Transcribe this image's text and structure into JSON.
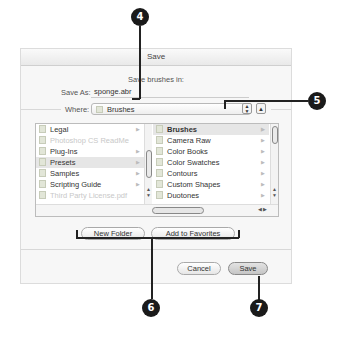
{
  "dialog": {
    "title": "Save",
    "prompt": "Save brushes in:",
    "save_as_label": "Save As:",
    "save_as_value": "sponge.abr",
    "where_label": "Where:",
    "where_value": "Brushes",
    "stepper_icon": "up-down-arrows",
    "expand_icon": "triangle-up"
  },
  "browser": {
    "left_column": [
      {
        "label": "Legal",
        "icon": "folder",
        "arrow": true,
        "state": "normal"
      },
      {
        "label": "Photoshop CS ReadMe",
        "icon": "document",
        "arrow": false,
        "state": "dim"
      },
      {
        "label": "Plug-Ins",
        "icon": "plugin-folder",
        "arrow": true,
        "state": "normal"
      },
      {
        "label": "Presets",
        "icon": "folder",
        "arrow": true,
        "state": "selected"
      },
      {
        "label": "Samples",
        "icon": "folder",
        "arrow": true,
        "state": "normal"
      },
      {
        "label": "Scripting Guide",
        "icon": "folder",
        "arrow": true,
        "state": "normal"
      },
      {
        "label": "Third Party License.pdf",
        "icon": "document",
        "arrow": false,
        "state": "dim"
      }
    ],
    "right_column": [
      {
        "label": "Brushes",
        "icon": "folder",
        "arrow": true,
        "state": "selected"
      },
      {
        "label": "Camera Raw",
        "icon": "folder",
        "arrow": true,
        "state": "normal"
      },
      {
        "label": "Color Books",
        "icon": "folder",
        "arrow": true,
        "state": "normal"
      },
      {
        "label": "Color Swatches",
        "icon": "folder",
        "arrow": true,
        "state": "normal"
      },
      {
        "label": "Contours",
        "icon": "folder",
        "arrow": true,
        "state": "normal"
      },
      {
        "label": "Custom Shapes",
        "icon": "folder",
        "arrow": true,
        "state": "normal"
      },
      {
        "label": "Duotones",
        "icon": "folder",
        "arrow": true,
        "state": "normal"
      }
    ]
  },
  "buttons": {
    "new_folder": "New Folder",
    "add_favorites": "Add to Favorites",
    "cancel": "Cancel",
    "save": "Save"
  },
  "callouts": {
    "c4": "4",
    "c5": "5",
    "c6": "6",
    "c7": "7"
  },
  "colors": {
    "callout": "#1a1a1a",
    "selection": "#e6e6e6"
  }
}
